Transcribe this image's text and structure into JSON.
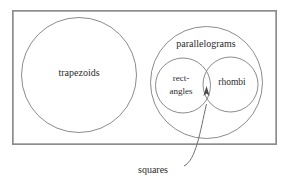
{
  "diagram": {
    "type": "venn-euler-diagram",
    "universe": {
      "name": "bounding-rectangle",
      "x": 12,
      "y": 10,
      "width": 265,
      "height": 135
    },
    "sets": [
      {
        "id": "trapezoids",
        "label": "trapezoids",
        "shape": "circle",
        "cx": 79,
        "cy": 75,
        "r": 57.5,
        "label_x": 79,
        "label_y": 74,
        "contains": [],
        "overlaps": []
      },
      {
        "id": "parallelograms",
        "label": "parallelograms",
        "shape": "circle",
        "cx": 206.5,
        "cy": 82.5,
        "r": 56,
        "label_x": 206,
        "label_y": 45,
        "contains": [
          "rectangles",
          "rhombi"
        ],
        "overlaps": []
      },
      {
        "id": "rectangles",
        "label_line1": "rect-",
        "label_line2": "angles",
        "label": "rectangles",
        "shape": "circle",
        "cx": 183,
        "cy": 85.5,
        "r": 27.5,
        "label_x": 181,
        "label_y": 80,
        "contains": [],
        "overlaps": [
          "rhombi"
        ]
      },
      {
        "id": "rhombi",
        "label": "rhombi",
        "shape": "circle",
        "cx": 230.5,
        "cy": 84.5,
        "r": 27.5,
        "label_x": 232,
        "label_y": 83,
        "contains": [],
        "overlaps": [
          "rectangles"
        ]
      }
    ],
    "callout": {
      "id": "squares",
      "label": "squares",
      "label_x": 153,
      "label_y": 171,
      "describes": "intersection of rectangles and rhombi",
      "leader_path": "M 184 166 C 196 160, 200 132, 206.5 104",
      "arrow_tip_x": 206.5,
      "arrow_tip_y": 88
    },
    "colors": {
      "background": "#ffffff",
      "set_outline": "#7e7e7e",
      "universe_outline": "#8d8d8d",
      "text": "#2b2b2b",
      "leader": "#6f6f6f",
      "arrow": "#4a4a4a"
    }
  }
}
